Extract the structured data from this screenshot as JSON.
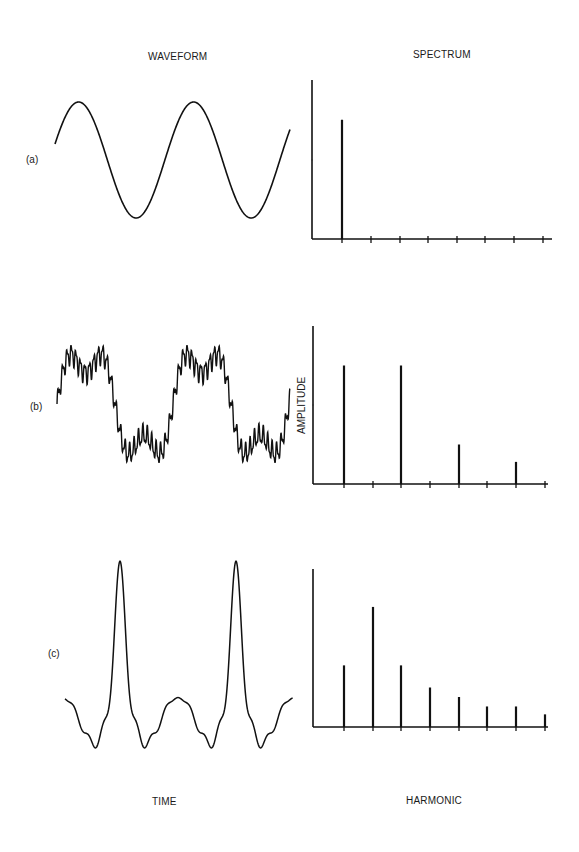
{
  "headers": {
    "waveform": "WAVEFORM",
    "spectrum": "SPECTRUM",
    "time": "TIME",
    "harmonic": "HARMONIC",
    "amplitude": "AMPLITUDE"
  },
  "panels": [
    {
      "id": "a",
      "label": "(a)"
    },
    {
      "id": "b",
      "label": "(b)"
    },
    {
      "id": "c",
      "label": "(c)"
    }
  ],
  "chart_data": [
    {
      "type": "line",
      "title": "WAVEFORM (a)",
      "description": "Pure sine wave, two cycles",
      "xlabel": "TIME",
      "ylabel": "",
      "grid": false
    },
    {
      "type": "bar",
      "title": "SPECTRUM (a)",
      "xlabel": "HARMONIC",
      "ylabel": "",
      "categories": [
        1,
        2,
        3,
        4,
        5,
        6,
        7,
        8
      ],
      "values": [
        0.75,
        0,
        0,
        0,
        0,
        0,
        0,
        0
      ],
      "ylim": [
        0,
        1
      ],
      "grid": false
    },
    {
      "type": "line",
      "title": "WAVEFORM (b)",
      "description": "Fundamental plus 3rd harmonic with high-frequency ripple, two cycles",
      "xlabel": "TIME",
      "ylabel": "",
      "grid": false
    },
    {
      "type": "bar",
      "title": "SPECTRUM (b)",
      "xlabel": "HARMONIC",
      "ylabel": "AMPLITUDE",
      "categories": [
        1,
        2,
        3,
        4,
        5,
        6,
        7,
        8
      ],
      "values": [
        0.75,
        0,
        0.75,
        0,
        0.25,
        0,
        0.14,
        0
      ],
      "ylim": [
        0,
        1
      ],
      "grid": false
    },
    {
      "type": "line",
      "title": "WAVEFORM (c)",
      "description": "Periodic sharp pulse train, two tall narrow peaks with low ripple",
      "xlabel": "TIME",
      "ylabel": "",
      "grid": false
    },
    {
      "type": "bar",
      "title": "SPECTRUM (c)",
      "xlabel": "HARMONIC",
      "ylabel": "",
      "categories": [
        1,
        2,
        3,
        4,
        5,
        6,
        7,
        8
      ],
      "values": [
        0.39,
        0.76,
        0.39,
        0.25,
        0.19,
        0.13,
        0.13,
        0.08
      ],
      "ylim": [
        0,
        1
      ],
      "grid": false
    }
  ],
  "layout": {
    "spectra": [
      {
        "axis_x": 312,
        "top": 80,
        "base": 239,
        "right": 552,
        "ticks": [
          342,
          371,
          400,
          428,
          457,
          485,
          514,
          543
        ],
        "ytick": 160
      },
      {
        "axis_x": 313,
        "top": 326,
        "base": 484,
        "right": 548,
        "ticks": [
          344,
          373,
          401,
          430,
          459,
          487,
          516,
          545
        ],
        "ytick": 405
      },
      {
        "axis_x": 313,
        "top": 569,
        "base": 727,
        "right": 548,
        "ticks": [
          344,
          373,
          401,
          430,
          459,
          487,
          516,
          545
        ],
        "ytick": null
      }
    ],
    "colors": {
      "ink": "#111111",
      "background": "#ffffff"
    }
  }
}
